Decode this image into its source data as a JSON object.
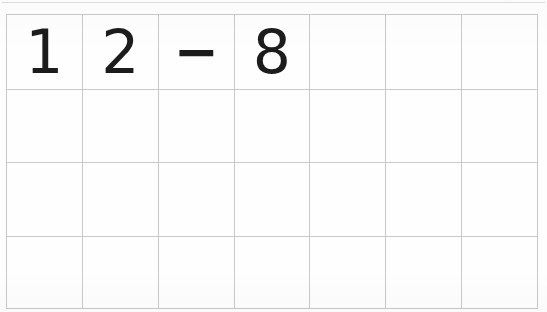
{
  "page": {
    "kind": "scanned-math-worksheet",
    "ink_color": "#1c1c1c",
    "grid_line_color": "#c9c9c9",
    "background_color": "#fefefe"
  },
  "grid": {
    "columns": 7,
    "rows": 4,
    "cells": [
      [
        "1",
        "2",
        "−",
        "8",
        "",
        "",
        ""
      ],
      [
        "",
        "",
        "",
        "",
        "",
        "",
        ""
      ],
      [
        "",
        "",
        "",
        "",
        "",
        "",
        ""
      ],
      [
        "",
        "",
        "",
        "",
        "",
        "",
        ""
      ]
    ]
  },
  "expression": {
    "written": "12 − 8",
    "operands": [
      "12",
      "8"
    ],
    "operator": "−",
    "operator_name": "minus-sign",
    "answer": ""
  }
}
